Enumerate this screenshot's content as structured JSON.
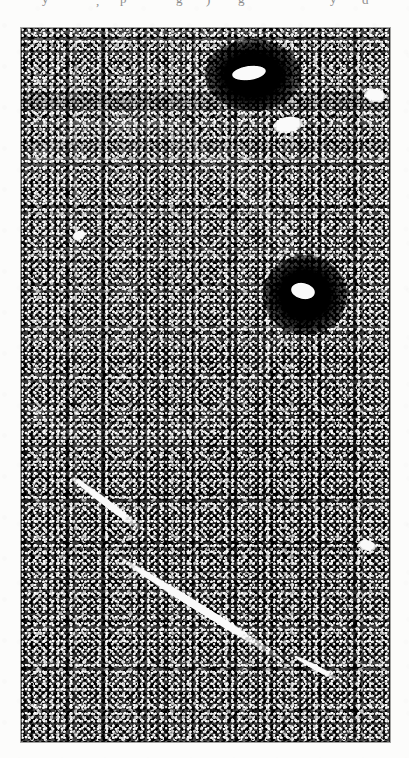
{
  "page": {
    "background_color": "#fcfcfb",
    "width": 409,
    "height": 758,
    "kind": "scanned-journal-page"
  },
  "text_remnant": {
    "description": "bottom-of-glyph descenders from the caption line cropped above the plate",
    "fragments": [
      {
        "text": "y",
        "x": 42,
        "y": -8
      },
      {
        "text": ",",
        "x": 96,
        "y": -6
      },
      {
        "text": "p",
        "x": 120,
        "y": -8
      },
      {
        "text": "g",
        "x": 176,
        "y": -8
      },
      {
        "text": ")",
        "x": 206,
        "y": -7
      },
      {
        "text": "g",
        "x": 238,
        "y": -8
      },
      {
        "text": "y",
        "x": 330,
        "y": -8
      },
      {
        "text": "d",
        "x": 362,
        "y": -7
      }
    ]
  },
  "plate": {
    "label": "micrograph-plate",
    "bounds": {
      "left": 21,
      "top": 28,
      "width": 369,
      "height": 714
    },
    "media": "grainy black-and-white halftone micrograph / autoradiograph",
    "base_color": "#4d4d4d",
    "highlight_color": "#ffffff",
    "shadow_color": "#000000",
    "texture": "dense high-contrast film-grain speckle across the whole field",
    "features": [
      {
        "name": "dark-halo-upper",
        "type": "dark-ellipse-with-bright-core",
        "center_x": 232,
        "center_y": 47,
        "halo_width": 96,
        "halo_height": 72,
        "core_width": 34,
        "core_height": 14,
        "core_offset_x": -4,
        "core_offset_y": -2,
        "core_rotation": -8
      },
      {
        "name": "dark-halo-middle",
        "type": "dark-ellipse-with-bright-core",
        "center_x": 284,
        "center_y": 267,
        "halo_width": 84,
        "halo_height": 80,
        "core_width": 24,
        "core_height": 16,
        "core_offset_x": -2,
        "core_offset_y": -4,
        "core_rotation": 12
      },
      {
        "name": "bright-blob-upper",
        "type": "bright-oval",
        "center_x": 267,
        "center_y": 97,
        "width": 30,
        "height": 16,
        "rotation": -10
      },
      {
        "name": "bright-patch-right-edge",
        "type": "bright-oval",
        "center_x": 354,
        "center_y": 67,
        "width": 22,
        "height": 13,
        "rotation": 8
      },
      {
        "name": "bright-patch-mid-left",
        "type": "bright-oval",
        "center_x": 58,
        "center_y": 207,
        "width": 14,
        "height": 9,
        "rotation": -22
      },
      {
        "name": "bright-patch-lower-right",
        "type": "bright-oval",
        "center_x": 346,
        "center_y": 517,
        "width": 18,
        "height": 11,
        "rotation": 14
      },
      {
        "name": "track-streak-upper",
        "type": "bright-diagonal-streak",
        "start_x": 49,
        "start_y": 447,
        "length": 96,
        "thickness": 7,
        "angle_deg": 37
      },
      {
        "name": "track-streak-main",
        "type": "bright-diagonal-streak",
        "start_x": 94,
        "start_y": 527,
        "length": 206,
        "thickness": 8,
        "angle_deg": 32
      },
      {
        "name": "track-streak-short",
        "type": "bright-diagonal-streak",
        "start_x": 272,
        "start_y": 627,
        "length": 54,
        "thickness": 5,
        "angle_deg": 28
      }
    ],
    "artifacts": [
      {
        "name": "scan-band-upper",
        "type": "horizontal-darker-band",
        "y": 64,
        "height": 18
      },
      {
        "name": "scan-band-lower",
        "type": "horizontal-darker-band",
        "y": 112,
        "height": 10
      },
      {
        "name": "lighter-arc",
        "type": "broad-curved-lighter-region",
        "region": "upper-left"
      }
    ]
  }
}
